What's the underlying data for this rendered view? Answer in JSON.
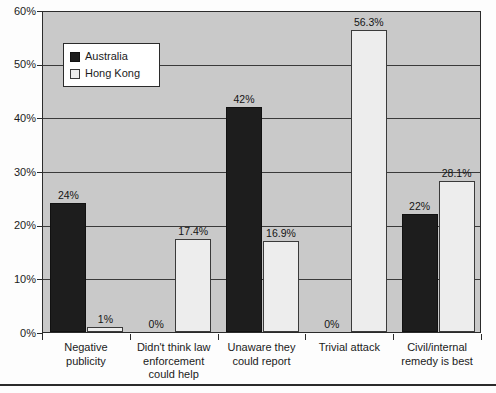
{
  "chart_data": {
    "type": "bar",
    "title": "",
    "subtitle": "",
    "xlabel": "",
    "ylabel": "",
    "ylim": [
      0,
      60
    ],
    "ytick_labels": [
      "0%",
      "10%",
      "20%",
      "30%",
      "40%",
      "50%",
      "60%"
    ],
    "ytick_values": [
      0,
      10,
      20,
      30,
      40,
      50,
      60
    ],
    "grid": true,
    "legend_position": "upper-left-inside",
    "categories": [
      "Negative publicity",
      "Didn't think law enforcement could help",
      "Unaware they could report",
      "Trivial attack",
      "Civil/internal remedy is best"
    ],
    "category_lines": [
      [
        "Negative",
        "publicity"
      ],
      [
        "Didn't think law",
        "enforcement",
        "could help"
      ],
      [
        "Unaware they",
        "could report"
      ],
      [
        "Trivial attack"
      ],
      [
        "Civil/internal",
        "remedy is best"
      ]
    ],
    "series": [
      {
        "name": "Australia",
        "color": "#1d1d1d",
        "values": [
          24,
          0,
          42,
          0,
          22
        ],
        "data_labels": [
          "24%",
          "0%",
          "42%",
          "0%",
          "22%"
        ]
      },
      {
        "name": "Hong Kong",
        "color": "#ededed",
        "values": [
          1,
          17.4,
          16.9,
          56.3,
          28.1
        ],
        "data_labels": [
          "1%",
          "17.4%",
          "16.9%",
          "56.3%",
          "28.1%"
        ]
      }
    ]
  },
  "legend": {
    "items": [
      {
        "label": "Australia",
        "swatch": "black-swatch"
      },
      {
        "label": "Hong Kong",
        "swatch": "white-swatch"
      }
    ]
  },
  "colors": {
    "plot_background": "#c9c9c9",
    "axis": "#2b2b2b",
    "gridline": "#3a3a3a",
    "australia_bar": "#1d1d1d",
    "hong_kong_bar": "#ededed",
    "page_background": "#fdfdfd",
    "text": "#1b1b1b"
  }
}
